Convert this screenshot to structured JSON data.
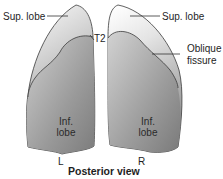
{
  "diagram": {
    "title": "Posterior view",
    "left_lung": {
      "side_label": "L",
      "sup_lobe_label": "Sup. lobe",
      "inf_lobe_label_line1": "Inf.",
      "inf_lobe_label_line2": "lobe",
      "landmark_label": "T2"
    },
    "right_lung": {
      "side_label": "R",
      "sup_lobe_label": "Sup. lobe",
      "inf_lobe_label_line1": "Inf.",
      "inf_lobe_label_line2": "lobe",
      "fissure_label_line1": "Oblique",
      "fissure_label_line2": "fissure"
    },
    "colors": {
      "upper_lobe_light": "#f4f4f4",
      "lower_lobe_dark": "#8a8a8a",
      "outline": "#3a3a3a",
      "leader_line": "#333333"
    }
  }
}
